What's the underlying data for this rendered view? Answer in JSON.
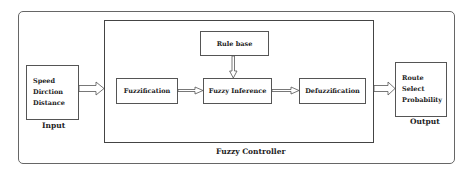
{
  "diagram": {
    "input": {
      "label": "Input",
      "items": [
        "Speed",
        "Dirction",
        "Distance"
      ]
    },
    "controller": {
      "label": "Fuzzy Controller",
      "blocks": {
        "fuzzification": "Fuzzification",
        "rule_base": "Rule base",
        "inference": "Fuzzy Inference",
        "defuzzification": "Defuzzification"
      }
    },
    "output": {
      "label": "Output",
      "items": [
        "Route",
        "Select",
        "Probability"
      ]
    },
    "colors": {
      "stroke": "#444444",
      "background": "#ffffff",
      "text": "#222222"
    }
  }
}
